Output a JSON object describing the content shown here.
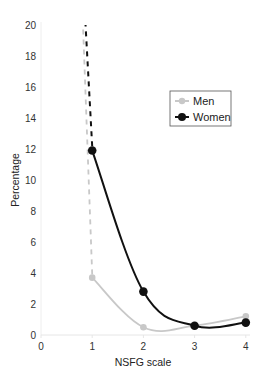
{
  "chart_data": {
    "type": "line",
    "title": "",
    "xlabel": "NSFG scale",
    "ylabel": "Percentage",
    "x": [
      0,
      1,
      2,
      3,
      4
    ],
    "xlim": [
      0,
      4
    ],
    "ylim": [
      0,
      20
    ],
    "xticks": [
      "0",
      "1",
      "2",
      "3",
      "4"
    ],
    "yticks": [
      "0",
      "2",
      "4",
      "6",
      "8",
      "10",
      "12",
      "14",
      "16",
      "18",
      "20"
    ],
    "grid": false,
    "legend_position": "upper right",
    "series": [
      {
        "name": "Men",
        "color": "#c8c8c8",
        "points": [
          [
            1,
            3.7
          ],
          [
            2,
            0.5
          ],
          [
            3,
            0.6
          ],
          [
            4,
            1.2
          ]
        ],
        "extrapolated_to_x0": "dashed line rising steeply above 20 between x=0.8 and x=1",
        "values": [
          null,
          3.7,
          0.5,
          0.6,
          1.2
        ]
      },
      {
        "name": "Women",
        "color": "#111111",
        "points": [
          [
            1,
            11.9
          ],
          [
            2,
            2.8
          ],
          [
            3,
            0.6
          ],
          [
            4,
            0.8
          ]
        ],
        "extrapolated_to_x0": "dashed line rising steeply above 20 between x=0.85 and x=1",
        "values": [
          null,
          11.9,
          2.8,
          0.6,
          0.8
        ]
      }
    ]
  },
  "axes": {
    "xlabel": "NSFG scale",
    "ylabel": "Percentage",
    "xticks": [
      "0",
      "1",
      "2",
      "3",
      "4"
    ],
    "yticks": [
      "0",
      "2",
      "4",
      "6",
      "8",
      "10",
      "12",
      "14",
      "16",
      "18",
      "20"
    ]
  },
  "legend": {
    "items": [
      {
        "label": "Men",
        "color": "#c8c8c8"
      },
      {
        "label": "Women",
        "color": "#111111"
      }
    ]
  }
}
